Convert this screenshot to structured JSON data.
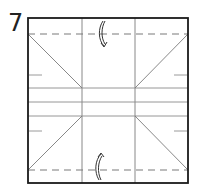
{
  "step": {
    "number": "7"
  },
  "diagram": {
    "type": "origami-fold-step",
    "square": {
      "x": 28,
      "y": 18,
      "w": 160,
      "h": 165
    },
    "colors": {
      "outline": "#1a1a1a",
      "crease": "#8a8a8a",
      "valley": "#7a7a7a",
      "arrow": "#333333"
    },
    "valley_folds": [
      {
        "name": "top-valley-fold",
        "y": 34
      },
      {
        "name": "bottom-valley-fold",
        "y": 170
      }
    ],
    "arrows": [
      {
        "name": "top-fold-arrow",
        "direction": "down"
      },
      {
        "name": "bottom-fold-arrow",
        "direction": "up"
      }
    ]
  }
}
